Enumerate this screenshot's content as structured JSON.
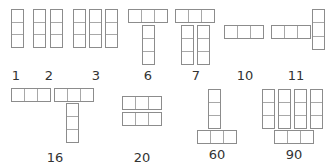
{
  "diagram": {
    "title": "",
    "line_color": "#8c8c8c",
    "groups": [
      {
        "label": "1",
        "label_pos": [
          16,
          69
        ],
        "strips": [
          {
            "dir": "v",
            "x": 11,
            "y": 9,
            "w": 13,
            "h": 39
          }
        ]
      },
      {
        "label": "2",
        "label_pos": [
          49,
          69
        ],
        "strips": [
          {
            "dir": "v",
            "x": 33,
            "y": 9,
            "w": 13,
            "h": 39
          },
          {
            "dir": "v",
            "x": 50,
            "y": 9,
            "w": 13,
            "h": 39
          }
        ]
      },
      {
        "label": "3",
        "label_pos": [
          96,
          69
        ],
        "strips": [
          {
            "dir": "v",
            "x": 73,
            "y": 9,
            "w": 13,
            "h": 39
          },
          {
            "dir": "v",
            "x": 89,
            "y": 9,
            "w": 13,
            "h": 39
          },
          {
            "dir": "v",
            "x": 105,
            "y": 9,
            "w": 13,
            "h": 39
          }
        ]
      },
      {
        "label": "6",
        "label_pos": [
          148,
          69
        ],
        "strips": [
          {
            "dir": "h",
            "x": 128,
            "y": 9,
            "w": 40,
            "h": 14
          },
          {
            "dir": "v",
            "x": 142,
            "y": 25,
            "w": 13,
            "h": 40
          }
        ]
      },
      {
        "label": "7",
        "label_pos": [
          196,
          69
        ],
        "strips": [
          {
            "dir": "h",
            "x": 175,
            "y": 9,
            "w": 40,
            "h": 14
          },
          {
            "dir": "v",
            "x": 181,
            "y": 25,
            "w": 13,
            "h": 40
          },
          {
            "dir": "v",
            "x": 197,
            "y": 25,
            "w": 13,
            "h": 40
          }
        ]
      },
      {
        "label": "10",
        "label_pos": [
          245,
          69
        ],
        "strips": [
          {
            "dir": "h",
            "x": 224,
            "y": 25,
            "w": 40,
            "h": 14
          }
        ]
      },
      {
        "label": "11",
        "label_pos": [
          296,
          69
        ],
        "strips": [
          {
            "dir": "h",
            "x": 271,
            "y": 25,
            "w": 40,
            "h": 14
          },
          {
            "dir": "v",
            "x": 312,
            "y": 9,
            "w": 13,
            "h": 41
          }
        ]
      },
      {
        "label": "16",
        "label_pos": [
          55,
          151
        ],
        "strips": [
          {
            "dir": "h",
            "x": 11,
            "y": 88,
            "w": 40,
            "h": 14
          },
          {
            "dir": "h",
            "x": 54,
            "y": 88,
            "w": 40,
            "h": 14
          },
          {
            "dir": "v",
            "x": 66,
            "y": 103,
            "w": 13,
            "h": 40
          }
        ]
      },
      {
        "label": "20",
        "label_pos": [
          142,
          151
        ],
        "strips": [
          {
            "dir": "h",
            "x": 122,
            "y": 96,
            "w": 40,
            "h": 14
          },
          {
            "dir": "h",
            "x": 122,
            "y": 112,
            "w": 40,
            "h": 14
          }
        ]
      },
      {
        "label": "60",
        "label_pos": [
          217,
          148
        ],
        "strips": [
          {
            "dir": "v",
            "x": 208,
            "y": 89,
            "w": 13,
            "h": 40
          },
          {
            "dir": "h",
            "x": 197,
            "y": 130,
            "w": 40,
            "h": 14
          }
        ]
      },
      {
        "label": "90",
        "label_pos": [
          294,
          148
        ],
        "strips": [
          {
            "dir": "v",
            "x": 262,
            "y": 89,
            "w": 13,
            "h": 40
          },
          {
            "dir": "v",
            "x": 278,
            "y": 89,
            "w": 13,
            "h": 40
          },
          {
            "dir": "v",
            "x": 294,
            "y": 89,
            "w": 13,
            "h": 40
          },
          {
            "dir": "v",
            "x": 310,
            "y": 89,
            "w": 13,
            "h": 40
          },
          {
            "dir": "h",
            "x": 274,
            "y": 130,
            "w": 40,
            "h": 14
          }
        ]
      }
    ]
  }
}
